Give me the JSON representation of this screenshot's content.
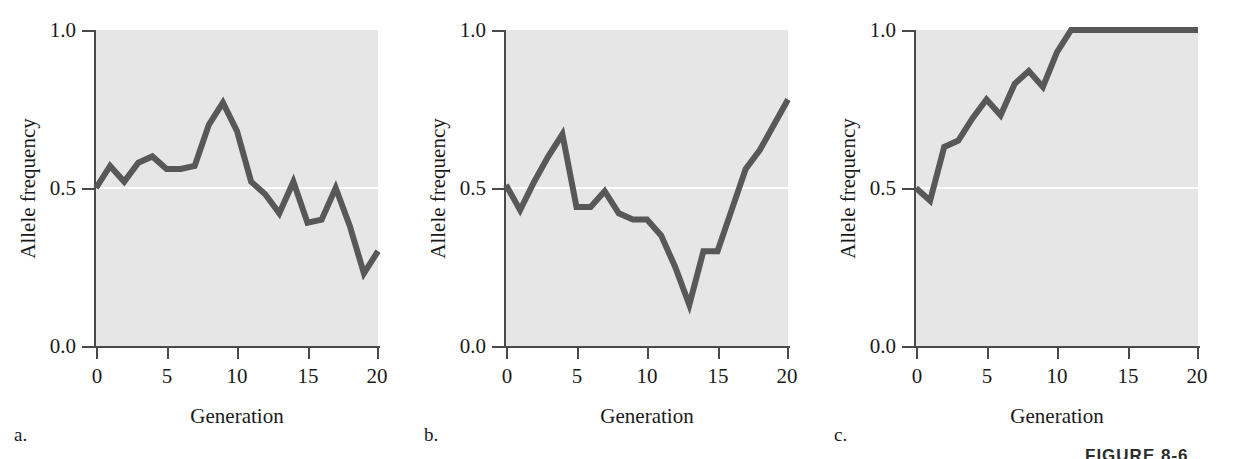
{
  "figure": {
    "caption_partial": "FIGURE 8-6",
    "panels": [
      {
        "letter": "a.",
        "id": "panel-a"
      },
      {
        "letter": "b.",
        "id": "panel-b"
      },
      {
        "letter": "c.",
        "id": "panel-c"
      }
    ]
  },
  "axes": {
    "ylabel": "Allele frequency",
    "xlabel": "Generation",
    "yticks": [
      "1.0",
      "0.5",
      "0.0"
    ],
    "ytick_values": [
      1.0,
      0.5,
      0.0
    ],
    "xticks": [
      "0",
      "5",
      "10",
      "15",
      "20"
    ],
    "xtick_values": [
      0,
      5,
      10,
      15,
      20
    ]
  },
  "colors": {
    "plot_background": "#e6e6e6",
    "line": "#585858",
    "axis": "#4a4a4a",
    "reference_line": "#ffffff",
    "text": "#1a1a1a",
    "page_background": "#ffffff"
  },
  "chart_data": [
    {
      "type": "line",
      "panel": "a",
      "title": "",
      "xlabel": "Generation",
      "ylabel": "Allele frequency",
      "xlim": [
        0,
        20
      ],
      "ylim": [
        0.0,
        1.0
      ],
      "grid": false,
      "legend": "none",
      "reference_line_y": 0.5,
      "x": [
        0,
        1,
        2,
        3,
        4,
        5,
        6,
        7,
        8,
        9,
        10,
        11,
        12,
        13,
        14,
        15,
        16,
        17,
        18,
        19,
        20
      ],
      "values": [
        0.5,
        0.57,
        0.52,
        0.58,
        0.6,
        0.56,
        0.56,
        0.57,
        0.7,
        0.77,
        0.68,
        0.52,
        0.48,
        0.42,
        0.52,
        0.39,
        0.4,
        0.5,
        0.38,
        0.23,
        0.3
      ],
      "annotation": "Allele frequency drifts without fixation; ends near 0.30"
    },
    {
      "type": "line",
      "panel": "b",
      "title": "",
      "xlabel": "Generation",
      "ylabel": "Allele frequency",
      "xlim": [
        0,
        20
      ],
      "ylim": [
        0.0,
        1.0
      ],
      "grid": false,
      "legend": "none",
      "reference_line_y": 0.5,
      "x": [
        0,
        1,
        2,
        3,
        4,
        5,
        6,
        7,
        8,
        9,
        10,
        11,
        12,
        13,
        14,
        15,
        16,
        17,
        18,
        19,
        20
      ],
      "values": [
        0.51,
        0.43,
        0.52,
        0.6,
        0.67,
        0.44,
        0.44,
        0.49,
        0.42,
        0.4,
        0.4,
        0.35,
        0.25,
        0.13,
        0.3,
        0.3,
        0.43,
        0.56,
        0.62,
        0.7,
        0.78
      ],
      "annotation": "Frequency dips to ~0.13 at generation 13 then rebounds to ~0.78"
    },
    {
      "type": "line",
      "panel": "c",
      "title": "",
      "xlabel": "Generation",
      "ylabel": "Allele frequency",
      "xlim": [
        0,
        20
      ],
      "ylim": [
        0.0,
        1.0
      ],
      "grid": false,
      "legend": "none",
      "reference_line_y": 0.5,
      "x": [
        0,
        1,
        2,
        3,
        4,
        5,
        6,
        7,
        8,
        9,
        10,
        11,
        12,
        13,
        14,
        15,
        16,
        17,
        18,
        19,
        20
      ],
      "values": [
        0.5,
        0.46,
        0.63,
        0.65,
        0.72,
        0.78,
        0.73,
        0.83,
        0.87,
        0.82,
        0.93,
        1.0,
        1.0,
        1.0,
        1.0,
        1.0,
        1.0,
        1.0,
        1.0,
        1.0,
        1.0
      ],
      "annotation": "Allele becomes fixed at 1.0 by generation 11"
    }
  ]
}
